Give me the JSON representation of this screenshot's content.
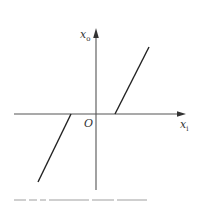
{
  "diagram": {
    "type": "dead-zone characteristic",
    "axes": {
      "x_label": "x",
      "x_subscript": "i",
      "y_label": "x",
      "y_subscript": "o",
      "origin_label": "O"
    },
    "colors": {
      "axis": "#555555",
      "curve": "#222222",
      "text": "#333333"
    },
    "geometry": {
      "origin": [
        96,
        114
      ],
      "x_axis": {
        "from": [
          14,
          114
        ],
        "to": [
          186,
          114
        ]
      },
      "y_axis": {
        "from": [
          96,
          190
        ],
        "to": [
          96,
          28
        ]
      },
      "segments": [
        {
          "name": "upper-linear-segment",
          "from": [
            115,
            114
          ],
          "to": [
            149,
            47
          ]
        },
        {
          "name": "lower-linear-segment",
          "from": [
            71,
            114
          ],
          "to": [
            38,
            182
          ]
        }
      ]
    },
    "caption": {
      "visible": "partially cut off at bottom edge",
      "text": ""
    }
  }
}
